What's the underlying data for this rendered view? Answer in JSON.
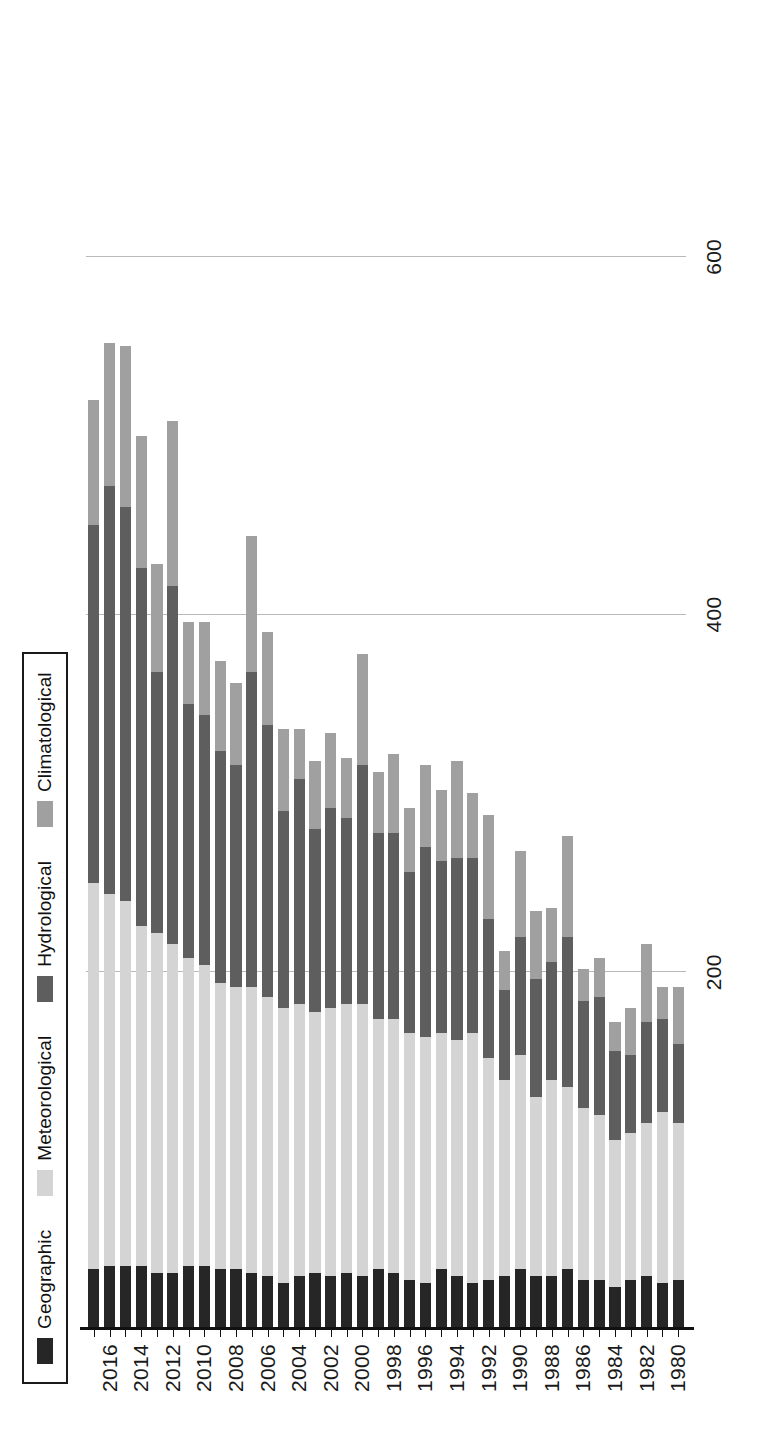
{
  "chart_data": {
    "type": "bar",
    "subtype": "stacked-horizontal",
    "title": "",
    "xlabel": "",
    "ylabel": "",
    "orientation": "rotated-90",
    "grid": true,
    "legend_position": "top-left",
    "value_axis_ticks": [
      "200",
      "400",
      "600"
    ],
    "value_axis_tick_values": [
      200,
      400,
      600
    ],
    "value_axis_range": [
      0,
      700
    ],
    "category_axis_label_step": 2,
    "legend": [
      {
        "label": "Geographic",
        "color": "#262626"
      },
      {
        "label": "Meteorological",
        "color": "#d4d4d4"
      },
      {
        "label": "Hydrological",
        "color": "#5e5e5e"
      },
      {
        "label": "Climatological",
        "color": "#a0a0a0"
      }
    ],
    "series": [
      {
        "name": "Geographic",
        "color": "#262626"
      },
      {
        "name": "Meteorological",
        "color": "#d4d4d4"
      },
      {
        "name": "Hydrological",
        "color": "#5e5e5e"
      },
      {
        "name": "Climatological",
        "color": "#a0a0a0"
      }
    ],
    "categories": [
      "1980",
      "1981",
      "1982",
      "1983",
      "1984",
      "1985",
      "1986",
      "1987",
      "1988",
      "1989",
      "1990",
      "1991",
      "1992",
      "1993",
      "1994",
      "1995",
      "1996",
      "1997",
      "1998",
      "1999",
      "2000",
      "2001",
      "2002",
      "2003",
      "2004",
      "2005",
      "2006",
      "2007",
      "2008",
      "2009",
      "2010",
      "2011",
      "2012",
      "2013",
      "2014",
      "2015",
      "2016",
      "2017"
    ],
    "rows": [
      {
        "year": "1980",
        "Geographic": 28,
        "Meteorological": 88,
        "Hydrological": 44,
        "Climatological": 32,
        "total": 192
      },
      {
        "year": "1981",
        "Geographic": 26,
        "Meteorological": 96,
        "Hydrological": 52,
        "Climatological": 18,
        "total": 192
      },
      {
        "year": "1982",
        "Geographic": 30,
        "Meteorological": 86,
        "Hydrological": 56,
        "Climatological": 44,
        "total": 216
      },
      {
        "year": "1983",
        "Geographic": 28,
        "Meteorological": 82,
        "Hydrological": 44,
        "Climatological": 26,
        "total": 180
      },
      {
        "year": "1984",
        "Geographic": 24,
        "Meteorological": 82,
        "Hydrological": 50,
        "Climatological": 16,
        "total": 172
      },
      {
        "year": "1985",
        "Geographic": 28,
        "Meteorological": 92,
        "Hydrological": 66,
        "Climatological": 22,
        "total": 208
      },
      {
        "year": "1986",
        "Geographic": 28,
        "Meteorological": 96,
        "Hydrological": 60,
        "Climatological": 18,
        "total": 202
      },
      {
        "year": "1987",
        "Geographic": 34,
        "Meteorological": 102,
        "Hydrological": 84,
        "Climatological": 56,
        "total": 276
      },
      {
        "year": "1988",
        "Geographic": 30,
        "Meteorological": 110,
        "Hydrological": 66,
        "Climatological": 30,
        "total": 236
      },
      {
        "year": "1989",
        "Geographic": 30,
        "Meteorological": 100,
        "Hydrological": 66,
        "Climatological": 38,
        "total": 234
      },
      {
        "year": "1990",
        "Geographic": 34,
        "Meteorological": 120,
        "Hydrological": 66,
        "Climatological": 48,
        "total": 268
      },
      {
        "year": "1991",
        "Geographic": 30,
        "Meteorological": 110,
        "Hydrological": 50,
        "Climatological": 22,
        "total": 212
      },
      {
        "year": "1992",
        "Geographic": 28,
        "Meteorological": 124,
        "Hydrological": 78,
        "Climatological": 58,
        "total": 288
      },
      {
        "year": "1993",
        "Geographic": 26,
        "Meteorological": 140,
        "Hydrological": 98,
        "Climatological": 36,
        "total": 300
      },
      {
        "year": "1994",
        "Geographic": 30,
        "Meteorological": 132,
        "Hydrological": 102,
        "Climatological": 54,
        "total": 318
      },
      {
        "year": "1995",
        "Geographic": 34,
        "Meteorological": 132,
        "Hydrological": 96,
        "Climatological": 40,
        "total": 302
      },
      {
        "year": "1996",
        "Geographic": 26,
        "Meteorological": 138,
        "Hydrological": 106,
        "Climatological": 46,
        "total": 316
      },
      {
        "year": "1997",
        "Geographic": 28,
        "Meteorological": 138,
        "Hydrological": 90,
        "Climatological": 36,
        "total": 292
      },
      {
        "year": "1998",
        "Geographic": 32,
        "Meteorological": 142,
        "Hydrological": 104,
        "Climatological": 44,
        "total": 322
      },
      {
        "year": "1999",
        "Geographic": 34,
        "Meteorological": 140,
        "Hydrological": 104,
        "Climatological": 34,
        "total": 312
      },
      {
        "year": "2000",
        "Geographic": 30,
        "Meteorological": 152,
        "Hydrological": 134,
        "Climatological": 62,
        "total": 378
      },
      {
        "year": "2001",
        "Geographic": 32,
        "Meteorological": 150,
        "Hydrological": 104,
        "Climatological": 34,
        "total": 320
      },
      {
        "year": "2002",
        "Geographic": 30,
        "Meteorological": 150,
        "Hydrological": 112,
        "Climatological": 42,
        "total": 334
      },
      {
        "year": "2003",
        "Geographic": 32,
        "Meteorological": 146,
        "Hydrological": 102,
        "Climatological": 38,
        "total": 318
      },
      {
        "year": "2004",
        "Geographic": 30,
        "Meteorological": 152,
        "Hydrological": 126,
        "Climatological": 28,
        "total": 336
      },
      {
        "year": "2005",
        "Geographic": 26,
        "Meteorological": 154,
        "Hydrological": 110,
        "Climatological": 46,
        "total": 336
      },
      {
        "year": "2006",
        "Geographic": 30,
        "Meteorological": 156,
        "Hydrological": 152,
        "Climatological": 52,
        "total": 390
      },
      {
        "year": "2007",
        "Geographic": 32,
        "Meteorological": 160,
        "Hydrological": 176,
        "Climatological": 76,
        "total": 444
      },
      {
        "year": "2008",
        "Geographic": 34,
        "Meteorological": 158,
        "Hydrological": 124,
        "Climatological": 46,
        "total": 362
      },
      {
        "year": "2009",
        "Geographic": 34,
        "Meteorological": 160,
        "Hydrological": 130,
        "Climatological": 50,
        "total": 374
      },
      {
        "year": "2010",
        "Geographic": 36,
        "Meteorological": 168,
        "Hydrological": 140,
        "Climatological": 52,
        "total": 396
      },
      {
        "year": "2011",
        "Geographic": 36,
        "Meteorological": 172,
        "Hydrological": 142,
        "Climatological": 46,
        "total": 396
      },
      {
        "year": "2012",
        "Geographic": 32,
        "Meteorological": 184,
        "Hydrological": 200,
        "Climatological": 92,
        "total": 508
      },
      {
        "year": "2013",
        "Geographic": 32,
        "Meteorological": 190,
        "Hydrological": 146,
        "Climatological": 60,
        "total": 428
      },
      {
        "year": "2014",
        "Geographic": 36,
        "Meteorological": 190,
        "Hydrological": 200,
        "Climatological": 74,
        "total": 500
      },
      {
        "year": "2015",
        "Geographic": 36,
        "Meteorological": 204,
        "Hydrological": 220,
        "Climatological": 90,
        "total": 550
      },
      {
        "year": "2016",
        "Geographic": 36,
        "Meteorological": 208,
        "Hydrological": 228,
        "Climatological": 80,
        "total": 552
      },
      {
        "year": "2017",
        "Geographic": 34,
        "Meteorological": 216,
        "Hydrological": 200,
        "Climatological": 70,
        "total": 520
      }
    ]
  }
}
